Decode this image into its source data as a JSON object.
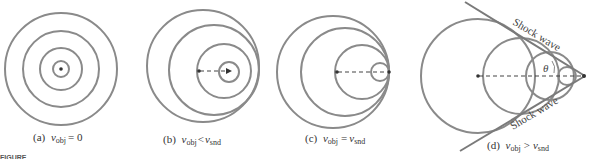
{
  "figure": {
    "partial_caption": "FIGURE",
    "panels": [
      {
        "id": "a",
        "label": "(a)",
        "caption_var": "v",
        "caption_sub": "obj",
        "caption_rel": "= 0",
        "description": "Stationary source: concentric circular wavefronts"
      },
      {
        "id": "b",
        "label": "(b)",
        "caption_var": "v",
        "caption_sub": "obj",
        "caption_rel": "<",
        "caption_var2": "v",
        "caption_sub2": "snd",
        "description": "Source moving slower than sound: wavefronts bunch up ahead"
      },
      {
        "id": "c",
        "label": "(c)",
        "caption_var": "v",
        "caption_sub": "obj",
        "caption_rel": "=",
        "caption_var2": "v",
        "caption_sub2": "snd",
        "description": "Source moving at speed of sound: wavefronts tangent at source"
      },
      {
        "id": "d",
        "label": "(d)",
        "caption_var": "v",
        "caption_sub": "obj",
        "caption_rel": ">",
        "caption_var2": "v",
        "caption_sub2": "snd",
        "description": "Supersonic source: Mach cone shock waves",
        "shock_label_top": "Shock wave",
        "shock_label_bottom": "Shock wave",
        "angle_label": "θ"
      }
    ]
  }
}
